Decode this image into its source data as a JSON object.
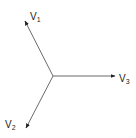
{
  "diagram": {
    "type": "vector-diagram",
    "colors": {
      "line": "#6b6b6b",
      "arrowhead": "#222222",
      "text": "#222222",
      "background": "#ffffff"
    },
    "origin": {
      "x": 53,
      "y": 76
    },
    "vectors": [
      {
        "id": "v1",
        "base": "V",
        "subscript": "1",
        "tip": {
          "x": 25,
          "y": 21
        },
        "label_pos": {
          "x": 30,
          "y": 20
        }
      },
      {
        "id": "v2",
        "base": "V",
        "subscript": "2",
        "tip": {
          "x": 26,
          "y": 128
        },
        "label_pos": {
          "x": 5,
          "y": 128
        }
      },
      {
        "id": "v3",
        "base": "V",
        "subscript": "3",
        "tip": {
          "x": 115,
          "y": 76
        },
        "label_pos": {
          "x": 119,
          "y": 82
        }
      }
    ]
  }
}
